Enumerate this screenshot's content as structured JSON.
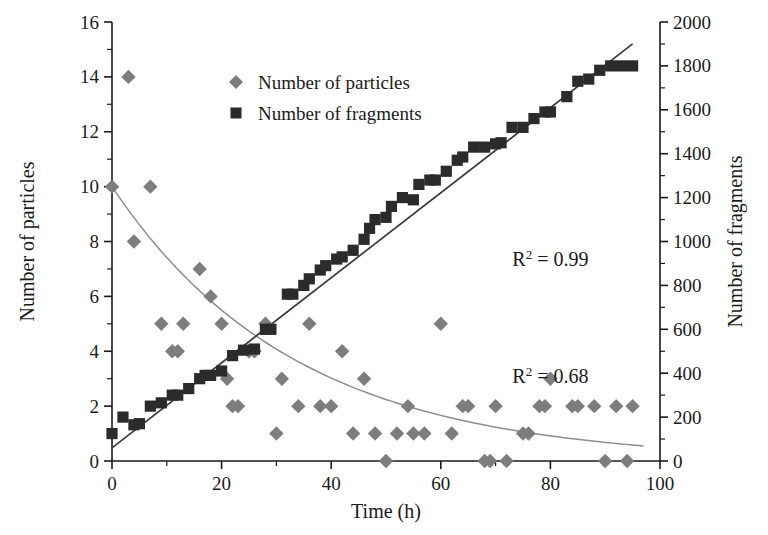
{
  "chart_data": {
    "type": "scatter",
    "title": "",
    "xlabel": "Time (h)",
    "ylabel": "Number of particles",
    "y2label": "Number of fragments",
    "xlim": [
      0,
      100
    ],
    "ylim": [
      0,
      16
    ],
    "y2lim": [
      0,
      2000
    ],
    "xticks": [
      0,
      20,
      40,
      60,
      80,
      100
    ],
    "xtick_labels": [
      "0",
      "20",
      "40",
      "60",
      "80",
      "100"
    ],
    "xminor_step": 10,
    "yticks": [
      0,
      2,
      4,
      6,
      8,
      10,
      12,
      14,
      16
    ],
    "ytick_labels": [
      "0",
      "2",
      "4",
      "6",
      "8",
      "10",
      "12",
      "14",
      "16"
    ],
    "yminor_step": 1,
    "y2ticks": [
      0,
      200,
      400,
      600,
      800,
      1000,
      1200,
      1400,
      1600,
      1800,
      2000
    ],
    "y2tick_labels": [
      "0",
      "200",
      "400",
      "600",
      "800",
      "1000",
      "1200",
      "1400",
      "1600",
      "1800",
      "2000"
    ],
    "y2minor_step": 100,
    "grid": false,
    "legend_position": "top-center",
    "series": [
      {
        "name": "Number of particles",
        "marker": "diamond",
        "color": "#7d7d7d",
        "axis": "left",
        "points": [
          [
            0,
            10
          ],
          [
            3,
            14
          ],
          [
            4,
            8
          ],
          [
            7,
            10
          ],
          [
            9,
            5
          ],
          [
            11,
            4
          ],
          [
            12,
            4
          ],
          [
            13,
            5
          ],
          [
            16,
            7
          ],
          [
            18,
            6
          ],
          [
            20,
            5
          ],
          [
            21,
            3
          ],
          [
            22,
            2
          ],
          [
            23,
            2
          ],
          [
            25,
            4
          ],
          [
            26,
            4
          ],
          [
            28,
            5
          ],
          [
            30,
            1
          ],
          [
            31,
            3
          ],
          [
            34,
            2
          ],
          [
            36,
            5
          ],
          [
            38,
            2
          ],
          [
            40,
            2
          ],
          [
            42,
            4
          ],
          [
            44,
            1
          ],
          [
            46,
            3
          ],
          [
            48,
            1
          ],
          [
            50,
            0
          ],
          [
            52,
            1
          ],
          [
            54,
            2
          ],
          [
            55,
            1
          ],
          [
            57,
            1
          ],
          [
            60,
            5
          ],
          [
            62,
            1
          ],
          [
            64,
            2
          ],
          [
            65,
            2
          ],
          [
            68,
            0
          ],
          [
            69,
            0
          ],
          [
            70,
            2
          ],
          [
            72,
            0
          ],
          [
            75,
            1
          ],
          [
            76,
            1
          ],
          [
            78,
            2
          ],
          [
            79,
            2
          ],
          [
            80,
            3
          ],
          [
            84,
            2
          ],
          [
            85,
            2
          ],
          [
            88,
            2
          ],
          [
            90,
            0
          ],
          [
            92,
            2
          ],
          [
            94,
            0
          ],
          [
            95,
            2
          ]
        ],
        "fit_curve": {
          "type": "exponential-decay",
          "r_squared": "0.68",
          "r2_label": "R2 = 0.68",
          "start": [
            0,
            10
          ],
          "end": [
            97,
            0.55
          ]
        }
      },
      {
        "name": "Number of fragments",
        "marker": "square",
        "color": "#2b2b2b",
        "axis": "right",
        "points": [
          [
            0,
            125
          ],
          [
            2,
            200
          ],
          [
            4,
            165
          ],
          [
            5,
            170
          ],
          [
            7,
            250
          ],
          [
            9,
            265
          ],
          [
            11,
            300
          ],
          [
            12,
            300
          ],
          [
            14,
            330
          ],
          [
            16,
            375
          ],
          [
            17,
            390
          ],
          [
            18,
            390
          ],
          [
            20,
            410
          ],
          [
            22,
            480
          ],
          [
            24,
            505
          ],
          [
            26,
            510
          ],
          [
            28,
            600
          ],
          [
            29,
            600
          ],
          [
            32,
            760
          ],
          [
            33,
            760
          ],
          [
            35,
            800
          ],
          [
            36,
            830
          ],
          [
            38,
            870
          ],
          [
            39,
            890
          ],
          [
            41,
            920
          ],
          [
            42,
            930
          ],
          [
            44,
            960
          ],
          [
            46,
            1010
          ],
          [
            47,
            1060
          ],
          [
            48,
            1100
          ],
          [
            50,
            1110
          ],
          [
            51,
            1160
          ],
          [
            53,
            1200
          ],
          [
            55,
            1190
          ],
          [
            56,
            1260
          ],
          [
            58,
            1280
          ],
          [
            59,
            1280
          ],
          [
            61,
            1320
          ],
          [
            63,
            1370
          ],
          [
            64,
            1385
          ],
          [
            66,
            1430
          ],
          [
            68,
            1430
          ],
          [
            70,
            1445
          ],
          [
            71,
            1450
          ],
          [
            73,
            1520
          ],
          [
            75,
            1520
          ],
          [
            77,
            1560
          ],
          [
            79,
            1590
          ],
          [
            80,
            1590
          ],
          [
            83,
            1660
          ],
          [
            85,
            1730
          ],
          [
            87,
            1740
          ],
          [
            89,
            1780
          ],
          [
            91,
            1800
          ],
          [
            93,
            1800
          ],
          [
            95,
            1800
          ]
        ],
        "fit_curve": {
          "type": "linear",
          "r_squared": "0.99",
          "r2_label": "R2 = 0.99",
          "start": [
            0,
            60
          ],
          "end": [
            95,
            1900
          ]
        }
      }
    ],
    "annotations": [
      {
        "text_base": "R",
        "text_sup": "2",
        "text_rest": " = 0.99",
        "x": 80,
        "y_axis": "left",
        "y": 7.1
      },
      {
        "text_base": "R",
        "text_sup": "2",
        "text_rest": " = 0.68",
        "x": 80,
        "y_axis": "left",
        "y": 2.85
      }
    ]
  },
  "legend": {
    "items": [
      {
        "label": "Number of particles",
        "marker": "diamond",
        "color": "#7d7d7d"
      },
      {
        "label": "Number of fragments",
        "marker": "square",
        "color": "#2b2b2b"
      }
    ]
  }
}
